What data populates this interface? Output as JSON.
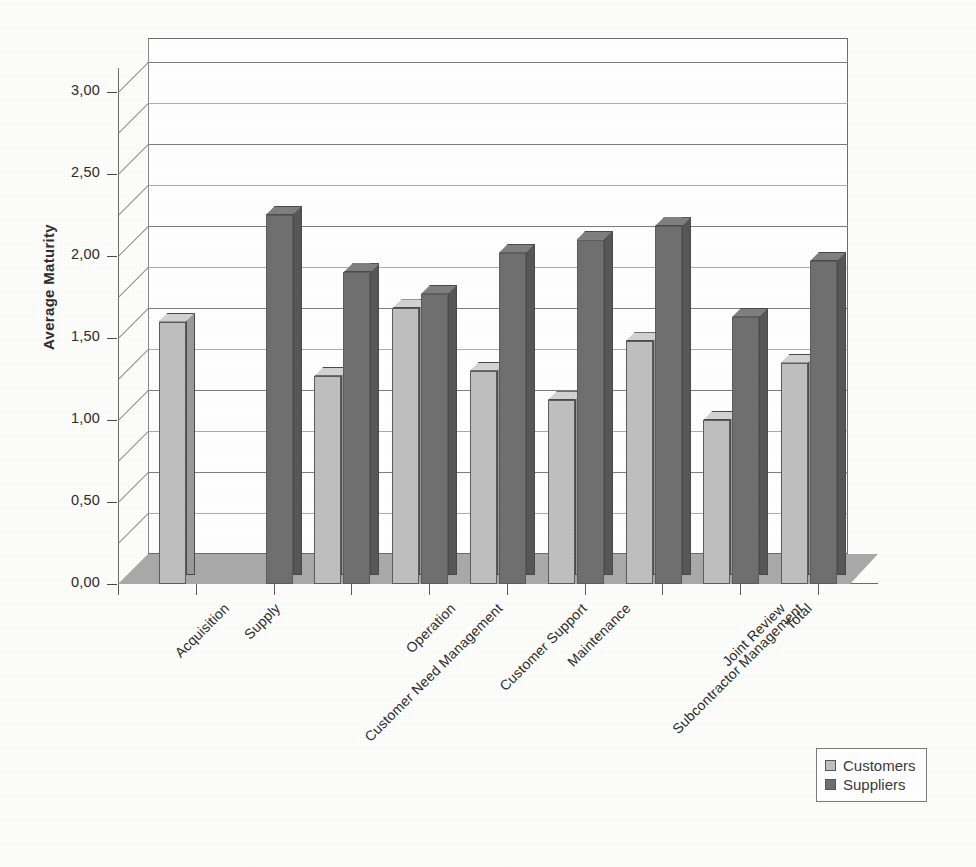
{
  "chart_data": {
    "type": "bar",
    "title": "",
    "xlabel": "",
    "ylabel": "Average Maturity",
    "ylim": [
      0,
      3
    ],
    "ytick_labels": [
      "0,00",
      "0,50",
      "1,00",
      "1,50",
      "2,00",
      "2,50",
      "3,00"
    ],
    "ytick_values": [
      0,
      0.5,
      1.0,
      1.5,
      2.0,
      2.5,
      3.0
    ],
    "minor_tick_step": 0.25,
    "grid": true,
    "legend_position": "bottom-right",
    "style": "3d-clustered-column",
    "decimal_separator": ",",
    "categories": [
      "Acquisition",
      "Supply",
      "Customer Need Management",
      "Operation",
      "Customer Support",
      "Maintenance",
      "Subcontractor Management",
      "Joint Review",
      "Total"
    ],
    "series": [
      {
        "name": "Customers",
        "color": "#bfbfbf",
        "values": [
          1.6,
          null,
          1.27,
          1.68,
          1.3,
          1.12,
          1.48,
          1.0,
          1.35
        ]
      },
      {
        "name": "Suppliers",
        "color": "#6f6f6f",
        "values": [
          null,
          2.25,
          1.9,
          1.77,
          2.02,
          2.1,
          2.18,
          1.63,
          1.97
        ]
      }
    ]
  },
  "legend": {
    "items": [
      {
        "label": "Customers",
        "swatch": "customers"
      },
      {
        "label": "Suppliers",
        "swatch": "suppliers"
      }
    ]
  }
}
